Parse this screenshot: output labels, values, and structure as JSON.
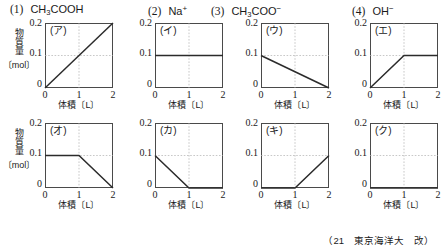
{
  "species_header": [
    {
      "number": "(1)",
      "formula_html": "CH<sub>3</sub>COOH",
      "plain": "CH3COOH",
      "left": 10
    },
    {
      "number": "(2)",
      "formula_html": "Na<sup>+</sup>",
      "plain": "Na+",
      "left": 148
    },
    {
      "number": "(3)",
      "formula_html": "CH<sub>3</sub>COO<sup>−</sup>",
      "plain": "CH3COO-",
      "left": 211
    },
    {
      "number": "(4)",
      "formula_html": "OH<sup>−</sup>",
      "plain": "OH-",
      "left": 352
    }
  ],
  "axes": {
    "y_label_vertical": "物質量",
    "y_unit": "〔mol〕",
    "y_ticks": [
      "0.2",
      "0.1",
      "0"
    ],
    "x_caption": "体積〔L〕",
    "x_ticks": [
      "0",
      "1",
      "2"
    ],
    "xlim": [
      0,
      2
    ],
    "ylim": [
      0,
      0.2
    ],
    "gridlines": "dotted at x=1 and y=0.1"
  },
  "footer": "（21　東京海洋大　改）",
  "colors": {
    "axis": "#4a4a4a",
    "curve": "#2b2b2b",
    "grid": "#b0b0b0",
    "text": "#1a1a1a",
    "background": "#ffffff"
  },
  "chart_data": [
    {
      "type": "line",
      "title": "(ア)",
      "xlabel": "体積〔L〕",
      "ylabel": "物質量〔mol〕",
      "xlim": [
        0,
        2
      ],
      "ylim": [
        0,
        0.2
      ],
      "xticks": [
        0,
        1,
        2
      ],
      "yticks": [
        0,
        0.1,
        0.2
      ],
      "grid": true,
      "x": [
        0,
        2
      ],
      "values": [
        0,
        0.2
      ],
      "description": "linear increase from 0 to 0.2"
    },
    {
      "type": "line",
      "title": "(イ)",
      "xlabel": "体積〔L〕",
      "ylabel": "物質量〔mol〕",
      "xlim": [
        0,
        2
      ],
      "ylim": [
        0,
        0.2
      ],
      "xticks": [
        0,
        1,
        2
      ],
      "yticks": [
        0,
        0.1,
        0.2
      ],
      "grid": true,
      "x": [
        0,
        2
      ],
      "values": [
        0.1,
        0.1
      ],
      "description": "constant at 0.1"
    },
    {
      "type": "line",
      "title": "(ウ)",
      "xlabel": "体積〔L〕",
      "ylabel": "物質量〔mol〕",
      "xlim": [
        0,
        2
      ],
      "ylim": [
        0,
        0.2
      ],
      "xticks": [
        0,
        1,
        2
      ],
      "yticks": [
        0,
        0.1,
        0.2
      ],
      "grid": true,
      "x": [
        0,
        2
      ],
      "values": [
        0.1,
        0
      ],
      "description": "linear decrease from 0.1 to 0"
    },
    {
      "type": "line",
      "title": "(エ)",
      "xlabel": "体積〔L〕",
      "ylabel": "物質量〔mol〕",
      "xlim": [
        0,
        2
      ],
      "ylim": [
        0,
        0.2
      ],
      "xticks": [
        0,
        1,
        2
      ],
      "yticks": [
        0,
        0.1,
        0.2
      ],
      "grid": true,
      "x": [
        0,
        1,
        2
      ],
      "values": [
        0,
        0.1,
        0.1
      ],
      "description": "rises to 0.1 at x=1 then constant"
    },
    {
      "type": "line",
      "title": "(オ)",
      "xlabel": "体積〔L〕",
      "ylabel": "物質量〔mol〕",
      "xlim": [
        0,
        2
      ],
      "ylim": [
        0,
        0.2
      ],
      "xticks": [
        0,
        1,
        2
      ],
      "yticks": [
        0,
        0.1,
        0.2
      ],
      "grid": true,
      "x": [
        0,
        1,
        2
      ],
      "values": [
        0.1,
        0.1,
        0
      ],
      "description": "constant 0.1 until x=1 then decreases to 0"
    },
    {
      "type": "line",
      "title": "(カ)",
      "xlabel": "体積〔L〕",
      "ylabel": "物質量〔mol〕",
      "xlim": [
        0,
        2
      ],
      "ylim": [
        0,
        0.2
      ],
      "xticks": [
        0,
        1,
        2
      ],
      "yticks": [
        0,
        0.1,
        0.2
      ],
      "grid": true,
      "x": [
        0,
        1,
        2
      ],
      "values": [
        0.1,
        0,
        0
      ],
      "description": "decreases to 0 at x=1 then constant at 0"
    },
    {
      "type": "line",
      "title": "(キ)",
      "xlabel": "体積〔L〕",
      "ylabel": "物質量〔mol〕",
      "xlim": [
        0,
        2
      ],
      "ylim": [
        0,
        0.2
      ],
      "xticks": [
        0,
        1,
        2
      ],
      "yticks": [
        0,
        0.1,
        0.2
      ],
      "grid": true,
      "x": [
        0,
        1,
        2
      ],
      "values": [
        0,
        0,
        0.1
      ],
      "description": "zero until x=1 then rises to 0.1"
    },
    {
      "type": "line",
      "title": "(ク)",
      "xlabel": "体積〔L〕",
      "ylabel": "物質量〔mol〕",
      "xlim": [
        0,
        2
      ],
      "ylim": [
        0,
        0.2
      ],
      "xticks": [
        0,
        1,
        2
      ],
      "yticks": [
        0,
        0.1,
        0.2
      ],
      "grid": true,
      "x": [
        0,
        2
      ],
      "values": [
        0,
        0
      ],
      "description": "constant at 0"
    }
  ],
  "panel_layout": [
    {
      "index": 0,
      "left": 0,
      "top": 20,
      "show_y_caption": true
    },
    {
      "index": 1,
      "left": 110,
      "top": 20,
      "show_y_caption": false
    },
    {
      "index": 2,
      "left": 216,
      "top": 20,
      "show_y_caption": false
    },
    {
      "index": 3,
      "left": 325,
      "top": 20,
      "show_y_caption": false
    },
    {
      "index": 4,
      "left": 0,
      "top": 120,
      "show_y_caption": true
    },
    {
      "index": 5,
      "left": 110,
      "top": 120,
      "show_y_caption": false
    },
    {
      "index": 6,
      "left": 216,
      "top": 120,
      "show_y_caption": false
    },
    {
      "index": 7,
      "left": 325,
      "top": 120,
      "show_y_caption": false
    }
  ]
}
